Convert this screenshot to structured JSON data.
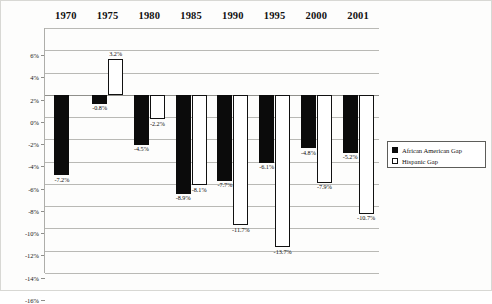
{
  "chart_data": {
    "type": "bar",
    "title": "",
    "xlabel": "",
    "ylabel": "",
    "categories": [
      "1970",
      "1975",
      "1980",
      "1985",
      "1990",
      "1995",
      "2000",
      "2001"
    ],
    "series": [
      {
        "name": "African American Gap",
        "color": "#0b0b0b",
        "style": "filled",
        "values": [
          -7.2,
          -0.8,
          -4.5,
          -8.9,
          -7.7,
          -6.1,
          -4.8,
          -5.2
        ],
        "labels": [
          "-7.2%",
          "-0.8%",
          "-4.5%",
          "-8.9%",
          "-7.7%",
          "-6.1%",
          "-4.8%",
          "-5.2%"
        ]
      },
      {
        "name": "Hispanic Gap",
        "color": "#ffffff",
        "style": "outlined",
        "values": [
          null,
          3.2,
          -2.2,
          -8.1,
          -11.7,
          -13.7,
          -7.9,
          -10.7
        ],
        "labels": [
          "",
          "3.2%",
          "-2.2%",
          "-8.1%",
          "-11.7%",
          "-13.7%",
          "-7.9%",
          "-10.7%"
        ]
      }
    ],
    "ylim": [
      -16,
      6
    ],
    "ytick_values": [
      6,
      4,
      2,
      0,
      -2,
      -4,
      -6,
      -8,
      -10,
      -12,
      -14,
      -16
    ],
    "ytick_labels": [
      "6%",
      "4%",
      "2%",
      "0%",
      "-2%",
      "-4%",
      "-6%",
      "-8%",
      "-10%",
      "-12%",
      "-14%",
      "-16%"
    ],
    "grid": true,
    "legend_position": "right"
  },
  "legend": {
    "entries": [
      {
        "label": "African American Gap",
        "swatch": "black"
      },
      {
        "label": "Hispanic Gap",
        "swatch": "white"
      }
    ]
  }
}
